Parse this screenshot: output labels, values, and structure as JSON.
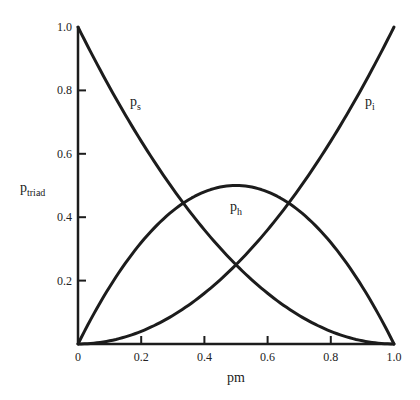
{
  "chart_data": {
    "type": "line",
    "title": "",
    "xlabel": "pm",
    "ylabel": "p_triad",
    "ylabel_main": "p",
    "ylabel_sub": "triad",
    "xlim": [
      0,
      1.0
    ],
    "ylim": [
      0,
      1.0
    ],
    "grid": false,
    "legend": "inline curve labels",
    "x_ticks": [
      "0",
      "0.2",
      "0.4",
      "0.6",
      "0.8",
      "1.0"
    ],
    "y_ticks": [
      "0.2",
      "0.4",
      "0.6",
      "0.8",
      "1.0"
    ],
    "x": [
      0,
      0.1,
      0.2,
      0.3,
      0.4,
      0.5,
      0.6,
      0.7,
      0.8,
      0.9,
      1.0
    ],
    "series": [
      {
        "name": "p_s",
        "label_main": "p",
        "label_sub": "s",
        "formula": "(1-pm)^2",
        "values": [
          1.0,
          0.81,
          0.64,
          0.49,
          0.36,
          0.25,
          0.16,
          0.09,
          0.04,
          0.01,
          0.0
        ]
      },
      {
        "name": "p_h",
        "label_main": "p",
        "label_sub": "h",
        "formula": "2*pm*(1-pm)",
        "values": [
          0.0,
          0.18,
          0.32,
          0.42,
          0.48,
          0.5,
          0.48,
          0.42,
          0.32,
          0.18,
          0.0
        ]
      },
      {
        "name": "p_i",
        "label_main": "p",
        "label_sub": "i",
        "formula": "pm^2",
        "values": [
          0.0,
          0.01,
          0.04,
          0.09,
          0.16,
          0.25,
          0.36,
          0.49,
          0.64,
          0.81,
          1.0
        ]
      }
    ],
    "intersections": [
      {
        "between": [
          "p_s",
          "p_h"
        ],
        "x": 0.333,
        "y": 0.444
      },
      {
        "between": [
          "p_s",
          "p_i"
        ],
        "x": 0.5,
        "y": 0.25
      },
      {
        "between": [
          "p_h",
          "p_i"
        ],
        "x": 0.667,
        "y": 0.444
      }
    ]
  }
}
